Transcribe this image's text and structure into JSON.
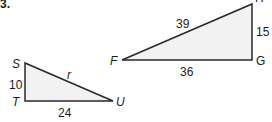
{
  "problem_number": "3.",
  "triangles": [
    {
      "name": "STU",
      "vertices": {
        "S": "S",
        "T": "T",
        "U": "U"
      },
      "sides": {
        "ST": "10",
        "TU": "24",
        "SU": "r"
      },
      "fill": "#f2f2f2"
    },
    {
      "name": "FGH",
      "vertices": {
        "F": "F",
        "G": "G",
        "H": "H"
      },
      "sides": {
        "FH": "39",
        "GH": "15",
        "FG": "36"
      },
      "fill": "#f2f2f2"
    }
  ],
  "colors": {
    "stroke": "#2a2a2a",
    "fill": "#f2f2f2",
    "text": "#1a1a1a"
  }
}
